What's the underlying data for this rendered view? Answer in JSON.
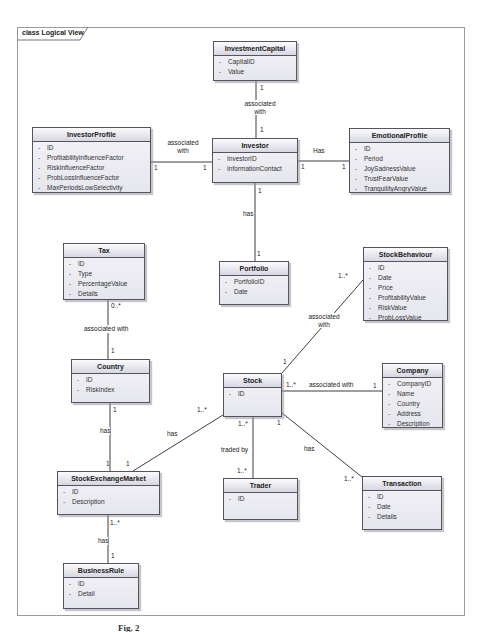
{
  "frame": {
    "title": "class Logical View"
  },
  "caption": "Fig. 2",
  "uml": {
    "private_marker": "-"
  },
  "classes": [
    {
      "name": "InvestmentCapital",
      "attributes": [
        "CapitalID",
        "Value"
      ]
    },
    {
      "name": "InvestorProfile",
      "attributes": [
        "ID",
        "ProfitabilityInfluenceFactor",
        "RiskInfluenceFactor",
        "ProbLossInfluenceFactor",
        "MaxPeriodsLowSelectivity"
      ]
    },
    {
      "name": "Investor",
      "attributes": [
        "InvestorID",
        "InformationContact"
      ]
    },
    {
      "name": "EmotionalProfile",
      "attributes": [
        "ID",
        "Period",
        "JoySadnessValue",
        "TrustFearValue",
        "TranquilityAngryValue"
      ]
    },
    {
      "name": "Tax",
      "attributes": [
        "ID",
        "Type",
        "PercentageValue",
        "Details"
      ]
    },
    {
      "name": "Portfolio",
      "attributes": [
        "PortfolioID",
        "Date"
      ]
    },
    {
      "name": "StockBehaviour",
      "attributes": [
        "ID",
        "Date",
        "Price",
        "ProfitabilityValue",
        "RiskValue",
        "ProbLossValue"
      ]
    },
    {
      "name": "Country",
      "attributes": [
        "ID",
        "RiskIndex"
      ]
    },
    {
      "name": "Stock",
      "attributes": [
        "ID"
      ]
    },
    {
      "name": "Company",
      "attributes": [
        "CompanyID",
        "Name",
        "Country",
        "Address",
        "Description"
      ]
    },
    {
      "name": "StockExchangeMarket",
      "attributes": [
        "ID",
        "Description"
      ]
    },
    {
      "name": "Trader",
      "attributes": [
        "ID"
      ]
    },
    {
      "name": "Transaction",
      "attributes": [
        "ID",
        "Date",
        "Details"
      ]
    },
    {
      "name": "BusinessRule",
      "attributes": [
        "ID",
        "Detail"
      ]
    }
  ],
  "associations": [
    {
      "from": "InvestmentCapital",
      "to": "Investor",
      "label": "associated with",
      "m1": "1",
      "m2": "1"
    },
    {
      "from": "InvestorProfile",
      "to": "Investor",
      "label": "associated with",
      "m1": "1",
      "m2": "1"
    },
    {
      "from": "Investor",
      "to": "EmotionalProfile",
      "label": "Has",
      "m1": "1",
      "m2": "1"
    },
    {
      "from": "Investor",
      "to": "Portfolio",
      "label": "has",
      "m1": "1",
      "m2": "1"
    },
    {
      "from": "Tax",
      "to": "Country",
      "label": "associated with",
      "m1": "0..*",
      "m2": "1"
    },
    {
      "from": "Country",
      "to": "StockExchangeMarket",
      "label": "has",
      "m1": "1",
      "m2": "1"
    },
    {
      "from": "Stock",
      "to": "StockExchangeMarket",
      "label": "has",
      "m1": "1..*",
      "m2": "1"
    },
    {
      "from": "Stock",
      "to": "Trader",
      "label": "traded by",
      "m1": "1..*",
      "m2": "1..*"
    },
    {
      "from": "Stock",
      "to": "Transaction",
      "label": "has",
      "m1": "1",
      "m2": "1..*"
    },
    {
      "from": "Stock",
      "to": "Company",
      "label": "associated with",
      "m1": "1..*",
      "m2": "1"
    },
    {
      "from": "Stock",
      "to": "StockBehaviour",
      "label": "associated with",
      "m1": "1",
      "m2": "1..*"
    },
    {
      "from": "StockExchangeMarket",
      "to": "BusinessRule",
      "label": "has",
      "m1": "1..*",
      "m2": "1"
    }
  ]
}
